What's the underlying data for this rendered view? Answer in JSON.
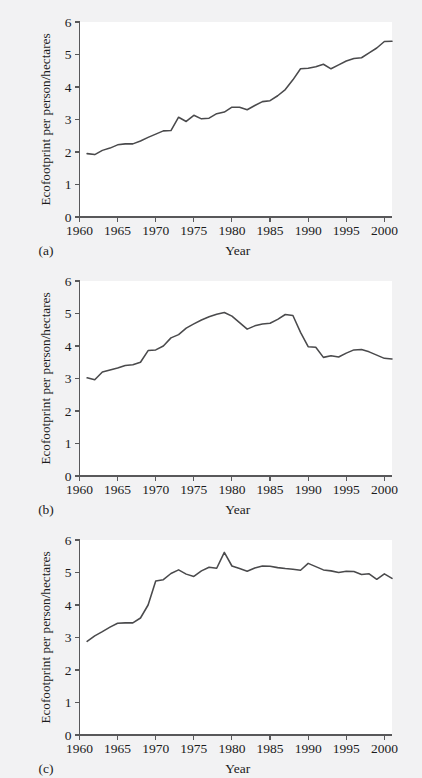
{
  "figure": {
    "background_color": "#f2f2f3",
    "plot_background_color": "#ffffff",
    "line_color": "#4a4a4c",
    "axis_color": "#58585a"
  },
  "panels": [
    {
      "letter": "(a)",
      "xlabel": "Year",
      "ylabel": "Ecofootprint per person/hectares"
    },
    {
      "letter": "(b)",
      "xlabel": "Year",
      "ylabel": "Ecofootprint per person/hectares"
    },
    {
      "letter": "(c)",
      "xlabel": "Year",
      "ylabel": "Ecofootprint per person/hectares"
    }
  ],
  "axes": {
    "y_ticks": [
      "0",
      "1",
      "2",
      "3",
      "4",
      "5",
      "6"
    ],
    "x_ticks": [
      "1960",
      "1965",
      "1970",
      "1975",
      "1980",
      "1985",
      "1990",
      "1995",
      "2000"
    ],
    "x_minor_step": 1,
    "grid": false,
    "legend": "none"
  },
  "chart_data": [
    {
      "type": "line",
      "panel": "(a)",
      "title": "",
      "xlabel": "Year",
      "ylabel": "Ecofootprint per person/hectares",
      "xlim": [
        1960,
        2001
      ],
      "ylim": [
        0,
        6
      ],
      "x_ticks": [
        1960,
        1965,
        1970,
        1975,
        1980,
        1985,
        1990,
        1995,
        2000
      ],
      "y_ticks": [
        0,
        1,
        2,
        3,
        4,
        5,
        6
      ],
      "grid": false,
      "legend_position": "none",
      "x": [
        1961,
        1962,
        1963,
        1964,
        1965,
        1966,
        1967,
        1968,
        1969,
        1970,
        1971,
        1972,
        1973,
        1974,
        1975,
        1976,
        1977,
        1978,
        1979,
        1980,
        1981,
        1982,
        1983,
        1984,
        1985,
        1986,
        1987,
        1988,
        1989,
        1990,
        1991,
        1992,
        1993,
        1994,
        1995,
        1996,
        1997,
        1998,
        1999,
        2000,
        2001
      ],
      "values": [
        1.95,
        1.92,
        2.05,
        2.12,
        2.22,
        2.25,
        2.25,
        2.34,
        2.45,
        2.55,
        2.65,
        2.66,
        3.07,
        2.94,
        3.13,
        3.02,
        3.04,
        3.18,
        3.23,
        3.38,
        3.38,
        3.3,
        3.43,
        3.55,
        3.58,
        3.73,
        3.92,
        4.22,
        4.56,
        4.58,
        4.62,
        4.7,
        4.56,
        4.68,
        4.8,
        4.88,
        4.9,
        5.05,
        5.2,
        5.4,
        5.41
      ]
    },
    {
      "type": "line",
      "panel": "(b)",
      "title": "",
      "xlabel": "Year",
      "ylabel": "Ecofootprint per person/hectares",
      "xlim": [
        1960,
        2001
      ],
      "ylim": [
        0,
        6
      ],
      "x_ticks": [
        1960,
        1965,
        1970,
        1975,
        1980,
        1985,
        1990,
        1995,
        2000
      ],
      "y_ticks": [
        0,
        1,
        2,
        3,
        4,
        5,
        6
      ],
      "grid": false,
      "legend_position": "none",
      "x": [
        1961,
        1962,
        1963,
        1964,
        1965,
        1966,
        1967,
        1968,
        1969,
        1970,
        1971,
        1972,
        1973,
        1974,
        1975,
        1976,
        1977,
        1978,
        1979,
        1980,
        1981,
        1982,
        1983,
        1984,
        1985,
        1986,
        1987,
        1988,
        1989,
        1990,
        1991,
        1992,
        1993,
        1994,
        1995,
        1996,
        1997,
        1998,
        1999,
        2000,
        2001
      ],
      "values": [
        3.02,
        2.96,
        3.2,
        3.26,
        3.32,
        3.4,
        3.42,
        3.5,
        3.86,
        3.88,
        4.0,
        4.25,
        4.35,
        4.55,
        4.68,
        4.8,
        4.9,
        4.98,
        5.03,
        4.92,
        4.72,
        4.52,
        4.62,
        4.68,
        4.7,
        4.82,
        4.97,
        4.94,
        4.42,
        3.98,
        3.96,
        3.65,
        3.7,
        3.66,
        3.78,
        3.88,
        3.89,
        3.82,
        3.72,
        3.62,
        3.6
      ]
    },
    {
      "type": "line",
      "panel": "(c)",
      "title": "",
      "xlabel": "Year",
      "ylabel": "Ecofootprint per person/hectares",
      "xlim": [
        1960,
        2001
      ],
      "ylim": [
        0,
        6
      ],
      "x_ticks": [
        1960,
        1965,
        1970,
        1975,
        1980,
        1985,
        1990,
        1995,
        2000
      ],
      "y_ticks": [
        0,
        1,
        2,
        3,
        4,
        5,
        6
      ],
      "grid": false,
      "legend_position": "none",
      "x": [
        1961,
        1962,
        1963,
        1964,
        1965,
        1966,
        1967,
        1968,
        1969,
        1970,
        1971,
        1972,
        1973,
        1974,
        1975,
        1976,
        1977,
        1978,
        1979,
        1980,
        1981,
        1982,
        1983,
        1984,
        1985,
        1986,
        1987,
        1988,
        1989,
        1990,
        1991,
        1992,
        1993,
        1994,
        1995,
        1996,
        1997,
        1998,
        1999,
        2000,
        2001
      ],
      "values": [
        2.88,
        3.05,
        3.18,
        3.32,
        3.44,
        3.45,
        3.45,
        3.6,
        4.0,
        4.74,
        4.78,
        4.97,
        5.08,
        4.95,
        4.88,
        5.05,
        5.16,
        5.13,
        5.62,
        5.2,
        5.12,
        5.04,
        5.14,
        5.2,
        5.19,
        5.15,
        5.12,
        5.1,
        5.07,
        5.28,
        5.18,
        5.08,
        5.05,
        5.0,
        5.04,
        5.03,
        4.94,
        4.96,
        4.79,
        4.96,
        4.82
      ]
    }
  ]
}
